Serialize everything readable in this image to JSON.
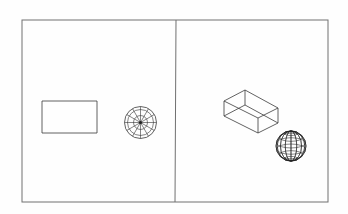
{
  "diagram": {
    "type": "cad-viewports",
    "colors": {
      "frame": "#707070",
      "geometry": "#3a3a3a",
      "background": "#ffffff"
    },
    "frame": {
      "x1": 22,
      "y1": 20,
      "x2": 328,
      "y2": 202
    },
    "divider": {
      "x_top": 176,
      "y_top": 20,
      "x_bottom": 175,
      "y_bottom": 202
    },
    "viewports": [
      {
        "name": "plan-view",
        "objects": [
          {
            "kind": "rectangle",
            "x": 42,
            "y": 101,
            "width": 55,
            "height": 32
          },
          {
            "kind": "sphere-plan",
            "cx": 140.5,
            "cy": 122.5,
            "radii": [
              16,
              13,
              7
            ],
            "radial_lines": 12
          }
        ]
      },
      {
        "name": "isometric-view",
        "objects": [
          {
            "kind": "box-wireframe",
            "vertices": {
              "top_back": [
                245,
                90
              ],
              "top_left": [
                224,
                101
              ],
              "top_right": [
                278,
                108
              ],
              "top_front": [
                258,
                118
              ],
              "bottom_back": [
                245,
                105
              ],
              "bottom_left": [
                224,
                116
              ],
              "bottom_right": [
                278,
                123
              ],
              "bottom_front": [
                258,
                133
              ]
            }
          },
          {
            "kind": "sphere-iso",
            "cx": 291,
            "cy": 146,
            "r": 15,
            "latitudes": 7,
            "longitudes": 8
          }
        ]
      }
    ]
  }
}
